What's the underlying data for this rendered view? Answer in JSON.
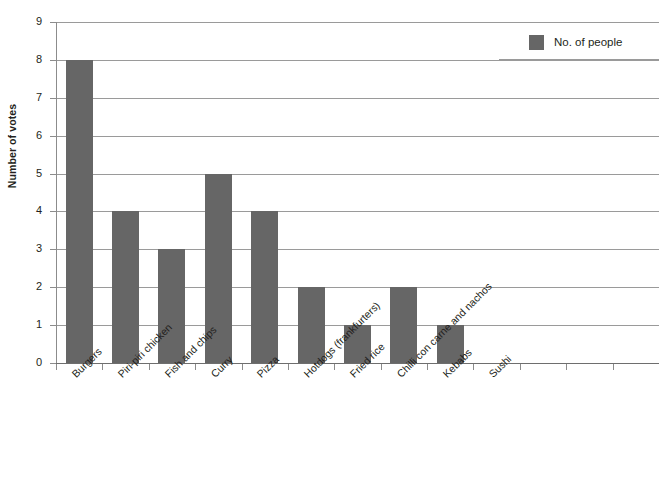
{
  "chart_data": {
    "type": "bar",
    "title": "",
    "xlabel": "",
    "ylabel": "Number of votes",
    "ylim": [
      0,
      9
    ],
    "ytick_labels": [
      "0",
      "1",
      "2",
      "3",
      "4",
      "5",
      "6",
      "7",
      "8",
      "9"
    ],
    "grid": true,
    "legend_position": "top-right",
    "categories": [
      "Burgers",
      "Piri-piri chicken",
      "Fish and chips",
      "Curry",
      "Pizza",
      "Hotdogs (frankfurters)",
      "Fried rice",
      "Chilli con carne and nachos",
      "Kebabs",
      "Sushi"
    ],
    "empty_slots": 3,
    "series": [
      {
        "name": "No. of people",
        "color": "#666666",
        "values": [
          8,
          4,
          3,
          5,
          4,
          2,
          1,
          2,
          1,
          0
        ]
      }
    ]
  },
  "legend": {
    "entry_label": "No. of people"
  },
  "colors": {
    "bar": "#666666",
    "gridline": "#9a9a9a",
    "axis": "#6e6e6e",
    "text": "#231f20",
    "background": "#ffffff"
  }
}
